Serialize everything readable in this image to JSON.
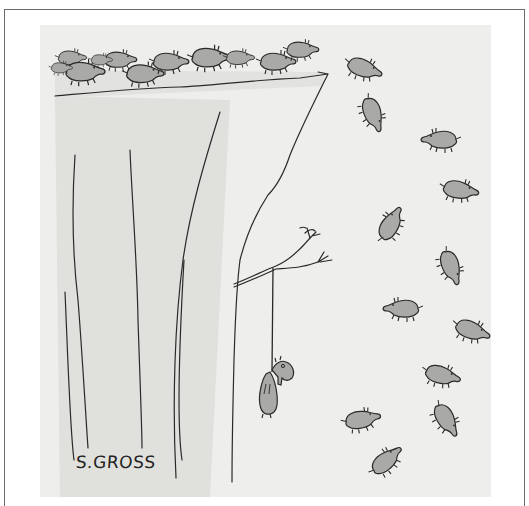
{
  "artwork": {
    "title": "Lemmings cartoon",
    "signature": "S.GROSS",
    "colors": {
      "panel_bg": "#eeeeec",
      "cliff_shade": "#d9d9d7",
      "lemming_fill": "#a9a9a7",
      "ink": "#2a2a2a",
      "frame": "#6a6a6a"
    },
    "scene": {
      "description": "A herd of lemmings runs off a cliff edge and falls; one lemming hangs by a rope from a small tree branch growing out of the cliff face.",
      "herd_on_cliff_count": 11,
      "falling_lemmings_count": 14,
      "hanging_lemming_count": 1
    }
  }
}
